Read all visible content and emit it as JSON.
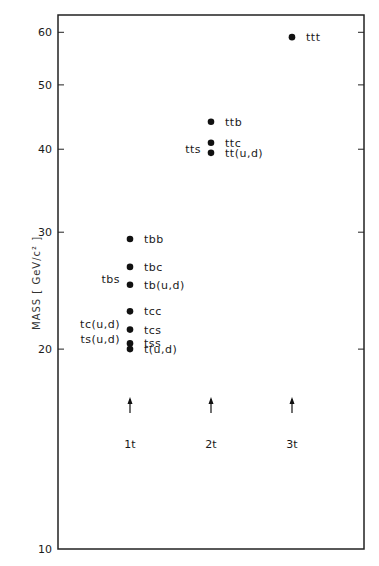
{
  "chart_data": {
    "type": "scatter",
    "title": "",
    "xlabel": "",
    "ylabel": "MASS  [ GeV/c² ]",
    "yscale": "log",
    "ylim": [
      10,
      65
    ],
    "yticks": [
      10,
      20,
      30,
      40,
      50,
      60
    ],
    "ytick_labels": [
      "10",
      "20",
      "30",
      "40",
      "50",
      "60"
    ],
    "grid": false,
    "categories": [
      "1t",
      "2t",
      "3t"
    ],
    "category_arrows": true,
    "series": [
      {
        "name": "1t",
        "points": [
          {
            "label": "tbb",
            "mass": 29.3
          },
          {
            "label": "tbc",
            "mass": 26.6
          },
          {
            "label": "tbs",
            "mass": 25.5,
            "label_side": "left"
          },
          {
            "label": "tb(u,d)",
            "mass": 25.0
          },
          {
            "label": "tcc",
            "mass": 22.8
          },
          {
            "label": "tc(u,d)",
            "mass": 21.8,
            "label_side": "left"
          },
          {
            "label": "tcs",
            "mass": 21.4
          },
          {
            "label": "ts(u,d)",
            "mass": 20.7,
            "label_side": "left"
          },
          {
            "label": "tss",
            "mass": 20.4
          },
          {
            "label": "t(u,d)",
            "mass": 20.0
          }
        ]
      },
      {
        "name": "2t",
        "points": [
          {
            "label": "ttb",
            "mass": 44.0
          },
          {
            "label": "ttc",
            "mass": 40.9
          },
          {
            "label": "tts",
            "mass": 40.0,
            "label_side": "left"
          },
          {
            "label": "tt(u,d)",
            "mass": 39.5
          }
        ]
      },
      {
        "name": "3t",
        "points": [
          {
            "label": "ttt",
            "mass": 59.0
          }
        ]
      }
    ]
  }
}
